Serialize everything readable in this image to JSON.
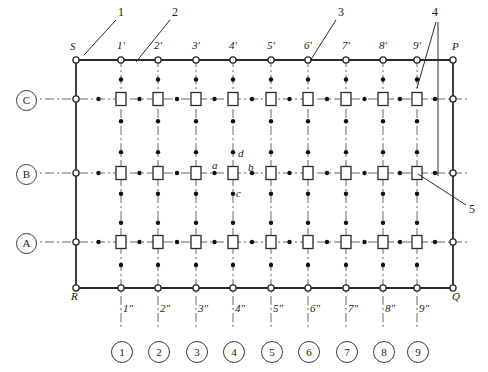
{
  "diagram": {
    "frame": {
      "corners": [
        {
          "name": "S",
          "label": "S",
          "x": 76,
          "y": 60
        },
        {
          "name": "P",
          "label": "P",
          "x": 453,
          "y": 60
        },
        {
          "name": "Q",
          "label": "Q",
          "x": 453,
          "y": 288
        },
        {
          "name": "R",
          "label": "R",
          "x": 76,
          "y": 288
        }
      ]
    },
    "columns": {
      "x_positions": [
        121,
        158,
        196,
        233,
        271,
        308,
        346,
        383,
        417
      ],
      "top_labels": [
        "1'",
        "2'",
        "3'",
        "4'",
        "5'",
        "6'",
        "7'",
        "8'",
        "9'"
      ],
      "bottom_labels": [
        "1″",
        "2″",
        "3″",
        "4″",
        "5″",
        "6″",
        "7″",
        "8″",
        "9″"
      ],
      "circled_labels": [
        "1",
        "2",
        "3",
        "4",
        "5",
        "6",
        "7",
        "8",
        "9"
      ]
    },
    "rows": {
      "y_positions": [
        99,
        173,
        242
      ],
      "labels": [
        "C",
        "B",
        "A"
      ]
    },
    "detail_labels": [
      {
        "text": "a",
        "x": 212,
        "y": 160
      },
      {
        "text": "b",
        "x": 248,
        "y": 162
      },
      {
        "text": "c",
        "x": 236,
        "y": 188
      },
      {
        "text": "d",
        "x": 238,
        "y": 148
      }
    ],
    "callouts": [
      {
        "text": "1",
        "x": 118,
        "y": 6,
        "target": "frame-corner-S"
      },
      {
        "text": "2",
        "x": 172,
        "y": 6,
        "target": "top-rail-segment"
      },
      {
        "text": "3",
        "x": 338,
        "y": 6,
        "target": "node-6prime"
      },
      {
        "text": "4",
        "x": 432,
        "y": 6,
        "target": "riser-9prime"
      },
      {
        "text": "5",
        "x": 469,
        "y": 203,
        "target": "device-box-b9"
      }
    ],
    "colors": {
      "line": "#2a2a2a",
      "dashdot": "#555555",
      "node_fill": "#ffffff",
      "background": "#ffffff"
    }
  }
}
